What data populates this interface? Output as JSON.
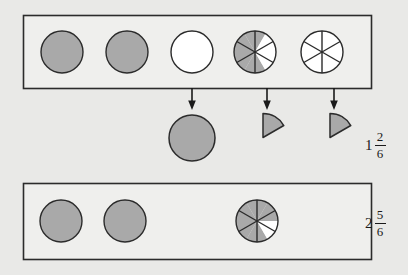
{
  "figure": {
    "background_color": "#e9e9e7",
    "box_fill": "#efefed",
    "stroke_color": "#2b2b2b",
    "shaded_fill": "#a9a9a9",
    "unshaded_fill": "#ffffff"
  },
  "rows": [
    {
      "id": "top-row",
      "label": {
        "whole": "1",
        "numerator": "2",
        "denominator": "6",
        "text": "1 2/6"
      },
      "shapes": [
        {
          "name": "circle-1",
          "type": "whole-circle",
          "state": "shaded",
          "sectors": 0,
          "shaded_sectors": 0
        },
        {
          "name": "circle-2",
          "type": "whole-circle",
          "state": "shaded",
          "sectors": 0,
          "shaded_sectors": 0
        },
        {
          "name": "circle-3",
          "type": "whole-circle",
          "state": "empty",
          "sectors": 0,
          "shaded_sectors": 0
        },
        {
          "name": "circle-4",
          "type": "sixths-circle",
          "state": "partial",
          "sectors": 6,
          "shaded_sectors": 4
        },
        {
          "name": "circle-5",
          "type": "sixths-circle",
          "state": "empty",
          "sectors": 6,
          "shaded_sectors": 0
        }
      ]
    },
    {
      "id": "bottom-row",
      "label": {
        "whole": "2",
        "numerator": "5",
        "denominator": "6",
        "text": "2 5/6"
      },
      "shapes": [
        {
          "name": "circle-6",
          "type": "whole-circle",
          "state": "shaded",
          "sectors": 0,
          "shaded_sectors": 0
        },
        {
          "name": "circle-7",
          "type": "whole-circle",
          "state": "shaded",
          "sectors": 0,
          "shaded_sectors": 0
        },
        {
          "name": "circle-8",
          "type": "sixths-circle",
          "state": "partial",
          "sectors": 6,
          "shaded_sectors": 5
        }
      ]
    }
  ],
  "middle": {
    "arrows": [
      {
        "name": "arrow-1",
        "from_shape": "circle-3",
        "to_shape": "result-circle"
      },
      {
        "name": "arrow-2",
        "from_shape": "circle-4",
        "to_shape": "result-wedge-1"
      },
      {
        "name": "arrow-3",
        "from_shape": "circle-5",
        "to_shape": "result-wedge-2"
      }
    ],
    "results": [
      {
        "name": "result-circle",
        "type": "whole-circle",
        "state": "shaded"
      },
      {
        "name": "result-wedge-1",
        "type": "sixth-wedge",
        "state": "shaded"
      },
      {
        "name": "result-wedge-2",
        "type": "sixth-wedge",
        "state": "shaded"
      }
    ]
  }
}
